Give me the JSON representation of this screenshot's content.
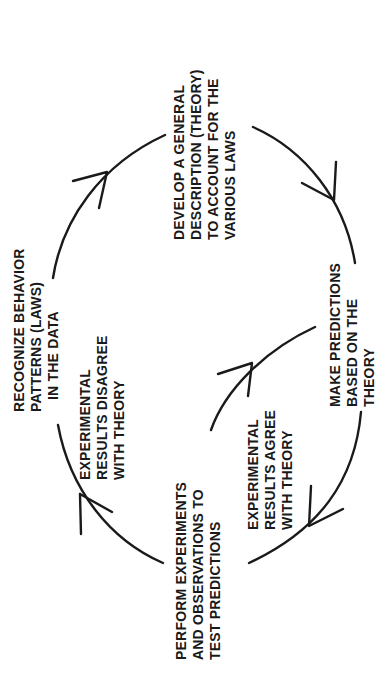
{
  "diagram": {
    "type": "cycle",
    "orientation": "rotated-90-ccw",
    "nodes": {
      "recognize": {
        "lines": [
          "RECOGNIZE  BEHAVIOR",
          "PATTERNS (LAWS)",
          "IN THE  DATA"
        ]
      },
      "develop": {
        "lines": [
          "DEVELOP  A  GENERAL",
          "DESCRIPTION  (THEORY)",
          "TO  ACCOUNT  FOR  THE",
          "VARIOUS  LAWS"
        ]
      },
      "predict": {
        "lines": [
          "MAKE  PREDICTIONS",
          "BASED  ON THE",
          "THEORY"
        ]
      },
      "perform": {
        "lines": [
          "PERFORM  EXPERIMENTS",
          "AND  OBSERVATIONS  TO",
          "TEST  PREDICTIONS"
        ]
      }
    },
    "edge_labels": {
      "disagree": {
        "lines": [
          "EXPERIMENTAL",
          "RESULTS  DISAGREE",
          "WITH  THEORY"
        ]
      },
      "agree": {
        "lines": [
          "EXPERIMENTAL",
          "RESULTS  AGREE",
          "WITH  THEORY"
        ]
      }
    },
    "edges": [
      {
        "from": "recognize",
        "to": "develop"
      },
      {
        "from": "develop",
        "to": "predict"
      },
      {
        "from": "predict",
        "to": "perform",
        "label": "agree"
      },
      {
        "from": "perform",
        "to": "predict",
        "label": "agree-loop"
      },
      {
        "from": "perform",
        "to": "recognize",
        "label": "disagree"
      }
    ],
    "colors": {
      "ink": "#1a1a1a",
      "background": "#ffffff"
    }
  }
}
